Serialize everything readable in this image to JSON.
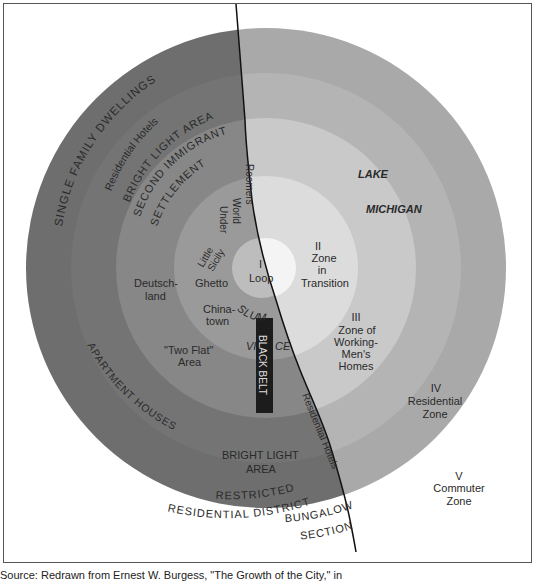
{
  "diagram": {
    "zones": [
      {
        "numeral": "I",
        "name": "Loop"
      },
      {
        "numeral": "II",
        "line1": "Zone",
        "line2": "in",
        "line3": "Transition"
      },
      {
        "numeral": "III",
        "line1": "Zone of",
        "line2": "Working-",
        "line3": "Men's",
        "line4": "Homes"
      },
      {
        "numeral": "IV",
        "line1": "Residential",
        "line2": "Zone"
      },
      {
        "numeral": "V",
        "line1": "Commuter",
        "line2": "Zone"
      }
    ],
    "lake": {
      "line1": "LAKE",
      "line2": "MICHIGAN"
    },
    "areas": {
      "single_family": "SINGLE FAMILY DWELLINGS",
      "residential_hotels_top": "Residential Hotels",
      "bright_light_top": "BRIGHT LIGHT AREA",
      "second_immigrant": "SECOND IMMIGRANT",
      "settlement": "SETTLEMENT",
      "roomers": "Roomers",
      "world": "World",
      "under": "Under",
      "little": "Little",
      "sicily": "Sicily",
      "ghetto": "Ghetto",
      "deutschland_1": "Deutsch-",
      "deutschland_2": "land",
      "chinatown_1": "China-",
      "chinatown_2": "town",
      "slum": "SLUM",
      "vice": "VICE",
      "two_flat_1": "\"Two Flat\"",
      "two_flat_2": "Area",
      "black_belt": "BLACK BELT",
      "apartment_houses": "APARTMENT HOUSES",
      "bright_light_bottom_1": "BRIGHT LIGHT",
      "bright_light_bottom_2": "AREA",
      "restricted": "RESTRICTED",
      "residential_district": "RESIDENTIAL DISTRICT",
      "residential_hotels_shore": "Residential Hotels",
      "bungalow": "BUNGALOW",
      "section": "SECTION"
    },
    "colors": {
      "outer_land": "#6e6e6e",
      "outer_lake": "#a8a8a8",
      "zone4_land": "#777777",
      "zone4_lake": "#b0b0b0",
      "zone3_land": "#8a8a8a",
      "zone3_lake": "#c8c8c8",
      "zone2_land": "#9a9a9a",
      "zone2_lake": "#dddddd",
      "loop": "#bdbdbd",
      "black_belt": "#1c1c1c"
    }
  },
  "caption": "Source: Redrawn from Ernest W. Burgess, \"The Growth of the City,\" in"
}
